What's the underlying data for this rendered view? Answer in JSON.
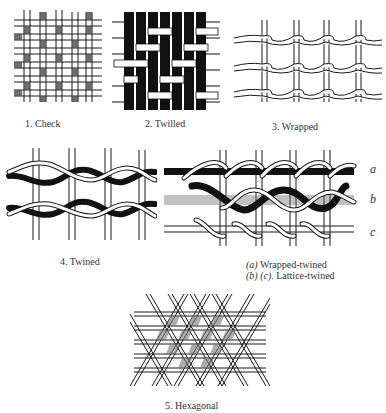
{
  "page": {
    "background": "#ffffff",
    "ink": "#1a1a1a"
  },
  "figures": [
    {
      "id": 1,
      "caption": "1. Check",
      "technique": "check"
    },
    {
      "id": 2,
      "caption": "2. Twilled",
      "technique": "twilled"
    },
    {
      "id": 3,
      "caption": "3. Wrapped",
      "technique": "wrapped"
    },
    {
      "id": 4,
      "caption": "4. Twined",
      "technique": "twined"
    },
    {
      "id": "4b",
      "caption_line1_prefix": "(a)",
      "caption_line1": " Wrapped-twined",
      "caption_line2_prefix": "(b) (c).",
      "caption_line2": " Lattice-twined",
      "row_labels": [
        "a",
        "b",
        "c"
      ],
      "technique": "wrapped-twined / lattice-twined"
    },
    {
      "id": 5,
      "caption": "5. Hexagonal",
      "technique": "hexagonal"
    }
  ]
}
